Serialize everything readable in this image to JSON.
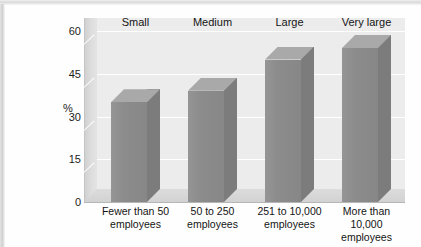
{
  "chart_data": {
    "type": "bar",
    "title": "",
    "subtitle": "",
    "xlabel": "",
    "ylabel": "%",
    "ylim": [
      0,
      60
    ],
    "yticks": [
      0,
      15,
      30,
      45,
      60
    ],
    "ytick_labels": [
      "0",
      "15",
      "30",
      "45",
      "60"
    ],
    "grid": true,
    "legend": "none",
    "style": "3d-column",
    "categories": [
      "Fewer than 50 employees",
      "50 to 250 employees",
      "251 to 10,000 employees",
      "More than 10,000 employees"
    ],
    "category_headers": [
      "Small",
      "Medium",
      "Large",
      "Very large"
    ],
    "category_lines": [
      [
        "Fewer than 50",
        "employees"
      ],
      [
        "50 to 250",
        "employees"
      ],
      [
        "251 to 10,000",
        "employees"
      ],
      [
        "More than",
        "10,000",
        "employees"
      ]
    ],
    "values": [
      35,
      39,
      50,
      54
    ],
    "series": [
      {
        "name": "%",
        "values": [
          35,
          39,
          50,
          54
        ]
      }
    ],
    "colors": {
      "bar_front": "#8c8c8c",
      "bar_top": "#a9a9a9",
      "bar_side": "#7c7c7c",
      "plot_background": "#ececec",
      "gridline": "#ffffff",
      "axis": "#b6b6b6",
      "text": "#141414"
    }
  }
}
